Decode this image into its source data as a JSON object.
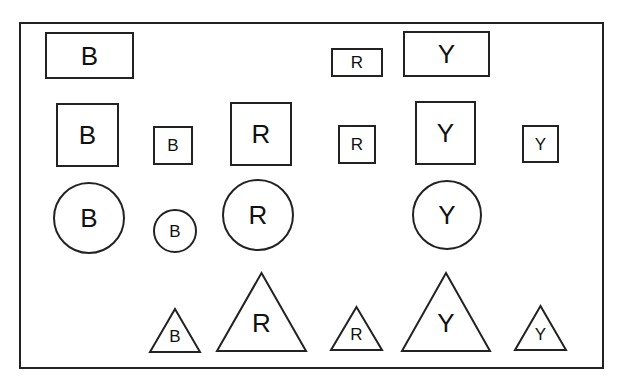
{
  "diagram": {
    "frame": {
      "x": 20,
      "y": 23,
      "w": 583,
      "h": 345,
      "stroke": "#222222"
    },
    "shapes": [
      {
        "id": "rect-b-wide",
        "type": "rect",
        "label": "B",
        "x": 46,
        "y": 33,
        "w": 87,
        "h": 45,
        "font": 26
      },
      {
        "id": "rect-r-wide-small",
        "type": "rect",
        "label": "R",
        "x": 332,
        "y": 49,
        "w": 50,
        "h": 27,
        "font": 17
      },
      {
        "id": "rect-y-wide",
        "type": "rect",
        "label": "Y",
        "x": 404,
        "y": 32,
        "w": 85,
        "h": 44,
        "font": 26
      },
      {
        "id": "square-b-large",
        "type": "rect",
        "label": "B",
        "x": 57,
        "y": 104,
        "w": 61,
        "h": 62,
        "font": 26
      },
      {
        "id": "square-b-small",
        "type": "rect",
        "label": "B",
        "x": 154,
        "y": 127,
        "w": 38,
        "h": 37,
        "font": 17
      },
      {
        "id": "square-r-large",
        "type": "rect",
        "label": "R",
        "x": 231,
        "y": 103,
        "w": 60,
        "h": 62,
        "font": 26
      },
      {
        "id": "square-r-small",
        "type": "rect",
        "label": "R",
        "x": 339,
        "y": 126,
        "w": 36,
        "h": 37,
        "font": 17
      },
      {
        "id": "square-y-large",
        "type": "rect",
        "label": "Y",
        "x": 416,
        "y": 102,
        "w": 59,
        "h": 62,
        "font": 26
      },
      {
        "id": "square-y-small",
        "type": "rect",
        "label": "Y",
        "x": 523,
        "y": 126,
        "w": 35,
        "h": 36,
        "font": 17
      },
      {
        "id": "circle-b-large",
        "type": "circle",
        "label": "B",
        "cx": 89,
        "cy": 218,
        "r": 35,
        "font": 26
      },
      {
        "id": "circle-b-small",
        "type": "circle",
        "label": "B",
        "cx": 175,
        "cy": 231,
        "r": 21,
        "font": 17
      },
      {
        "id": "circle-r-large",
        "type": "circle",
        "label": "R",
        "cx": 258,
        "cy": 215,
        "r": 35,
        "font": 26
      },
      {
        "id": "circle-y-large",
        "type": "circle",
        "label": "Y",
        "cx": 447,
        "cy": 215,
        "r": 34,
        "font": 26
      },
      {
        "id": "triangle-b-small",
        "type": "triangle",
        "label": "B",
        "x1": 150,
        "x2": 200,
        "apex": 309,
        "base": 352,
        "font": 17
      },
      {
        "id": "triangle-r-large",
        "type": "triangle",
        "label": "R",
        "x1": 217,
        "x2": 306,
        "apex": 273,
        "base": 351,
        "font": 26
      },
      {
        "id": "triangle-r-small",
        "type": "triangle",
        "label": "R",
        "x1": 331,
        "x2": 382,
        "apex": 307,
        "base": 350,
        "font": 17
      },
      {
        "id": "triangle-y-large",
        "type": "triangle",
        "label": "Y",
        "x1": 402,
        "x2": 490,
        "apex": 273,
        "base": 351,
        "font": 26
      },
      {
        "id": "triangle-y-small",
        "type": "triangle",
        "label": "Y",
        "x1": 515,
        "x2": 566,
        "apex": 306,
        "base": 350,
        "font": 17
      }
    ]
  }
}
